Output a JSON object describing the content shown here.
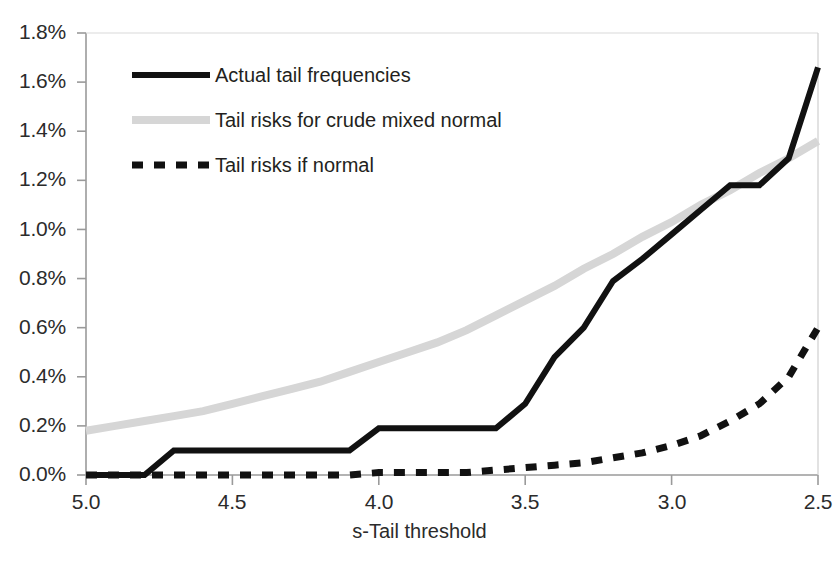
{
  "chart_data": {
    "type": "line",
    "title": "",
    "xlabel": "s-Tail threshold",
    "ylabel": "",
    "xlim": [
      5.0,
      2.5
    ],
    "ylim": [
      0.0,
      1.8
    ],
    "x_axis_reversed": true,
    "grid": false,
    "legend_position": "top-left inside plot",
    "y_tick_labels": [
      "1.8%",
      "1.6%",
      "1.4%",
      "1.2%",
      "1.0%",
      "0.8%",
      "0.6%",
      "0.4%",
      "0.2%",
      "0.0%"
    ],
    "y_tick_values": [
      1.8,
      1.6,
      1.4,
      1.2,
      1.0,
      0.8,
      0.6,
      0.4,
      0.2,
      0.0
    ],
    "x_tick_labels": [
      "5.0",
      "4.5",
      "4.0",
      "3.5",
      "3.0",
      "2.5"
    ],
    "x_tick_values": [
      5.0,
      4.5,
      4.0,
      3.5,
      3.0,
      2.5
    ],
    "y_unit": "%",
    "x": [
      5.0,
      4.9,
      4.8,
      4.7,
      4.6,
      4.5,
      4.4,
      4.3,
      4.2,
      4.1,
      4.0,
      3.9,
      3.8,
      3.7,
      3.6,
      3.5,
      3.4,
      3.3,
      3.2,
      3.1,
      3.0,
      2.9,
      2.8,
      2.7,
      2.6,
      2.5
    ],
    "series": [
      {
        "name": "Actual tail frequencies",
        "style": "solid",
        "color": "#111111",
        "width_px": 6,
        "values": [
          0.0,
          0.0,
          0.0,
          0.1,
          0.1,
          0.1,
          0.1,
          0.1,
          0.1,
          0.1,
          0.19,
          0.19,
          0.19,
          0.19,
          0.19,
          0.29,
          0.48,
          0.6,
          0.79,
          0.88,
          0.98,
          1.08,
          1.18,
          1.18,
          1.29,
          1.66
        ]
      },
      {
        "name": "Tail risks for crude mixed normal",
        "style": "solid",
        "color": "#d6d6d6",
        "width_px": 8,
        "values": [
          0.18,
          0.2,
          0.22,
          0.24,
          0.26,
          0.29,
          0.32,
          0.35,
          0.38,
          0.42,
          0.46,
          0.5,
          0.54,
          0.59,
          0.65,
          0.71,
          0.77,
          0.84,
          0.9,
          0.97,
          1.03,
          1.1,
          1.16,
          1.23,
          1.29,
          1.36
        ]
      },
      {
        "name": "Tail risks if normal",
        "style": "dashed",
        "color": "#111111",
        "width_px": 7,
        "values": [
          0.0,
          0.0,
          0.0,
          0.0,
          0.0,
          0.0,
          0.0,
          0.0,
          0.0,
          0.0,
          0.01,
          0.01,
          0.01,
          0.01,
          0.02,
          0.03,
          0.04,
          0.05,
          0.07,
          0.09,
          0.12,
          0.16,
          0.22,
          0.29,
          0.4,
          0.6
        ]
      }
    ]
  },
  "legend": {
    "items": [
      {
        "label": "Actual tail frequencies",
        "swatch": "solid-black-line-swatch"
      },
      {
        "label": "Tail risks for crude mixed normal",
        "swatch": "solid-grey-line-swatch"
      },
      {
        "label": "Tail risks if normal",
        "swatch": "dashed-black-line-swatch"
      }
    ]
  },
  "axes": {
    "x_title": "s-Tail threshold"
  }
}
